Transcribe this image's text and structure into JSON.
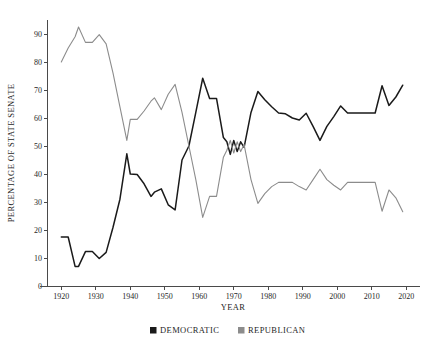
{
  "chart_data": {
    "type": "line",
    "title": "",
    "xlabel": "YEAR",
    "ylabel": "PERCENTAGE OF STATE SENATE",
    "xlim": [
      1916,
      2024
    ],
    "ylim": [
      0,
      95
    ],
    "xticks": [
      1920,
      1930,
      1940,
      1950,
      1960,
      1970,
      1980,
      1990,
      2000,
      2010,
      2020
    ],
    "yticks": [
      0,
      10,
      20,
      30,
      40,
      50,
      60,
      70,
      80,
      90
    ],
    "grid": false,
    "legend_position": "bottom",
    "series": [
      {
        "name": "DEMOCRATIC",
        "color": "#1a1a1a",
        "points": [
          [
            1920,
            17.5
          ],
          [
            1922,
            17.5
          ],
          [
            1924,
            7.0
          ],
          [
            1925,
            7.0
          ],
          [
            1927,
            12.3
          ],
          [
            1929,
            12.3
          ],
          [
            1931,
            9.8
          ],
          [
            1933,
            12.0
          ],
          [
            1935,
            21.0
          ],
          [
            1937,
            31.0
          ],
          [
            1939,
            47.2
          ],
          [
            1940,
            40.0
          ],
          [
            1942,
            39.8
          ],
          [
            1944,
            36.5
          ],
          [
            1946,
            32.0
          ],
          [
            1947,
            33.5
          ],
          [
            1949,
            34.7
          ],
          [
            1951,
            29.0
          ],
          [
            1953,
            27.2
          ],
          [
            1955,
            45.0
          ],
          [
            1957,
            50.0
          ],
          [
            1959,
            62.0
          ],
          [
            1961,
            74.2
          ],
          [
            1963,
            67.0
          ],
          [
            1965,
            67.0
          ],
          [
            1967,
            53.0
          ],
          [
            1968,
            51.5
          ],
          [
            1969,
            47.0
          ],
          [
            1970,
            52.0
          ],
          [
            1971,
            48.0
          ],
          [
            1972,
            51.5
          ],
          [
            1973,
            49.5
          ],
          [
            1975,
            62.0
          ],
          [
            1977,
            69.5
          ],
          [
            1979,
            66.5
          ],
          [
            1981,
            64.0
          ],
          [
            1983,
            61.8
          ],
          [
            1985,
            61.5
          ],
          [
            1987,
            60.0
          ],
          [
            1989,
            59.3
          ],
          [
            1991,
            61.7
          ],
          [
            1993,
            57.0
          ],
          [
            1995,
            52.0
          ],
          [
            1997,
            57.0
          ],
          [
            1999,
            60.5
          ],
          [
            2001,
            64.3
          ],
          [
            2003,
            61.8
          ],
          [
            2005,
            61.8
          ],
          [
            2007,
            61.8
          ],
          [
            2009,
            61.8
          ],
          [
            2011,
            61.8
          ],
          [
            2013,
            71.5
          ],
          [
            2015,
            64.5
          ],
          [
            2017,
            67.5
          ],
          [
            2019,
            71.7
          ]
        ]
      },
      {
        "name": "REPUBLICAN",
        "color": "#8c8c8c",
        "points": [
          [
            1920,
            80.0
          ],
          [
            1922,
            85.0
          ],
          [
            1924,
            89.0
          ],
          [
            1925,
            92.5
          ],
          [
            1927,
            87.0
          ],
          [
            1929,
            87.0
          ],
          [
            1931,
            89.8
          ],
          [
            1933,
            86.5
          ],
          [
            1935,
            76.0
          ],
          [
            1937,
            64.0
          ],
          [
            1939,
            52.0
          ],
          [
            1940,
            59.5
          ],
          [
            1942,
            59.5
          ],
          [
            1944,
            62.5
          ],
          [
            1946,
            66.0
          ],
          [
            1947,
            67.2
          ],
          [
            1949,
            63.0
          ],
          [
            1951,
            68.5
          ],
          [
            1953,
            72.0
          ],
          [
            1955,
            62.0
          ],
          [
            1957,
            50.0
          ],
          [
            1959,
            38.0
          ],
          [
            1961,
            24.5
          ],
          [
            1963,
            32.0
          ],
          [
            1965,
            32.0
          ],
          [
            1967,
            46.0
          ],
          [
            1968,
            48.5
          ],
          [
            1969,
            52.0
          ],
          [
            1970,
            47.5
          ],
          [
            1971,
            51.5
          ],
          [
            1972,
            48.0
          ],
          [
            1973,
            50.5
          ],
          [
            1975,
            38.0
          ],
          [
            1977,
            29.5
          ],
          [
            1979,
            33.0
          ],
          [
            1981,
            35.5
          ],
          [
            1983,
            37.0
          ],
          [
            1985,
            37.0
          ],
          [
            1987,
            37.0
          ],
          [
            1989,
            35.5
          ],
          [
            1991,
            34.3
          ],
          [
            1993,
            38.0
          ],
          [
            1995,
            41.7
          ],
          [
            1997,
            38.0
          ],
          [
            1999,
            36.0
          ],
          [
            2001,
            34.3
          ],
          [
            2003,
            37.0
          ],
          [
            2005,
            37.0
          ],
          [
            2007,
            37.0
          ],
          [
            2009,
            37.0
          ],
          [
            2011,
            37.0
          ],
          [
            2013,
            26.7
          ],
          [
            2015,
            34.3
          ],
          [
            2017,
            31.5
          ],
          [
            2019,
            26.5
          ]
        ]
      }
    ]
  },
  "legend": {
    "items": [
      {
        "label": "DEMOCRATIC",
        "color": "#1a1a1a"
      },
      {
        "label": "REPUBLICAN",
        "color": "#8c8c8c"
      }
    ]
  }
}
